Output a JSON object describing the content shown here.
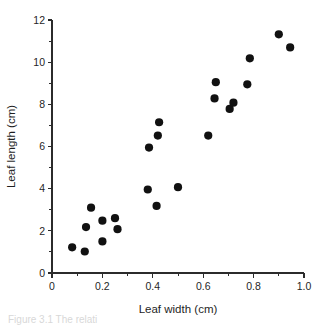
{
  "figure": {
    "caption_fragment": "Figure 3.1  The relati"
  },
  "chart_data": {
    "type": "scatter",
    "title": "",
    "xlabel": "Leaf width (cm)",
    "ylabel": "Leaf length (cm)",
    "xlim": [
      0,
      1.0
    ],
    "ylim": [
      0,
      12
    ],
    "xticks": [
      0,
      0.2,
      0.4,
      0.6,
      0.8,
      1.0
    ],
    "xtick_labels": [
      "0",
      "0.2",
      "0.4",
      "0.6",
      "0.8",
      "1.0"
    ],
    "yticks": [
      0,
      2,
      4,
      6,
      8,
      10,
      12
    ],
    "ytick_labels": [
      "0",
      "2",
      "4",
      "6",
      "8",
      "10",
      "12"
    ],
    "x_minor_ticks": [
      0.1,
      0.3,
      0.5,
      0.7,
      0.9
    ],
    "y_minor_ticks": [
      1,
      3,
      5,
      7,
      9,
      11
    ],
    "grid": false,
    "legend": null,
    "marker": {
      "shape": "circle",
      "color": "#111111",
      "size_px": 4.1
    },
    "series": [
      {
        "name": "leaf measurements",
        "points": [
          {
            "x": 0.08,
            "y": 1.22
          },
          {
            "x": 0.13,
            "y": 1.02
          },
          {
            "x": 0.135,
            "y": 2.18
          },
          {
            "x": 0.155,
            "y": 3.1
          },
          {
            "x": 0.2,
            "y": 1.5
          },
          {
            "x": 0.2,
            "y": 2.48
          },
          {
            "x": 0.25,
            "y": 2.6
          },
          {
            "x": 0.26,
            "y": 2.08
          },
          {
            "x": 0.38,
            "y": 3.96
          },
          {
            "x": 0.385,
            "y": 5.95
          },
          {
            "x": 0.415,
            "y": 3.18
          },
          {
            "x": 0.42,
            "y": 6.52
          },
          {
            "x": 0.425,
            "y": 7.15
          },
          {
            "x": 0.5,
            "y": 4.07
          },
          {
            "x": 0.62,
            "y": 6.52
          },
          {
            "x": 0.645,
            "y": 8.28
          },
          {
            "x": 0.65,
            "y": 9.05
          },
          {
            "x": 0.705,
            "y": 7.78
          },
          {
            "x": 0.72,
            "y": 8.08
          },
          {
            "x": 0.775,
            "y": 8.95
          },
          {
            "x": 0.785,
            "y": 10.18
          },
          {
            "x": 0.9,
            "y": 11.32
          },
          {
            "x": 0.945,
            "y": 10.7
          }
        ]
      }
    ]
  }
}
